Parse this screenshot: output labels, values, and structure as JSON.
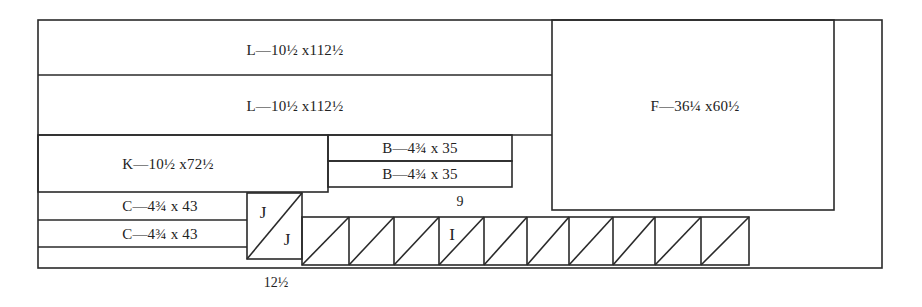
{
  "diagram": {
    "type": "cutting-layout",
    "stroke_color": "#2a2a2a",
    "background": "#ffffff",
    "pieces": [
      {
        "id": "L1",
        "label": "L—10½ x112½",
        "letter": "L",
        "size": "10½ x 112½"
      },
      {
        "id": "L2",
        "label": "L—10½ x112½",
        "letter": "L",
        "size": "10½ x 112½"
      },
      {
        "id": "F",
        "label": "F—36¼ x60½",
        "letter": "F",
        "size": "36¼ x 60½"
      },
      {
        "id": "K",
        "label": "K—10½ x72½",
        "letter": "K",
        "size": "10½ x 72½"
      },
      {
        "id": "B1",
        "label": "B—4¾ x 35",
        "letter": "B",
        "size": "4¾ x 35"
      },
      {
        "id": "B2",
        "label": "B—4¾ x 35",
        "letter": "B",
        "size": "4¾ x 35"
      },
      {
        "id": "C1",
        "label": "C—4¾ x 43",
        "letter": "C",
        "size": "4¾ x 43"
      },
      {
        "id": "C2",
        "label": "C—4¾ x 43",
        "letter": "C",
        "size": "4¾ x 43"
      }
    ],
    "triangles": {
      "j_labels": [
        "J",
        "J"
      ],
      "i_label": "I",
      "i_count": 10
    },
    "dimensions": {
      "i_strip_count_label": "9",
      "j_width_label": "12½"
    }
  }
}
